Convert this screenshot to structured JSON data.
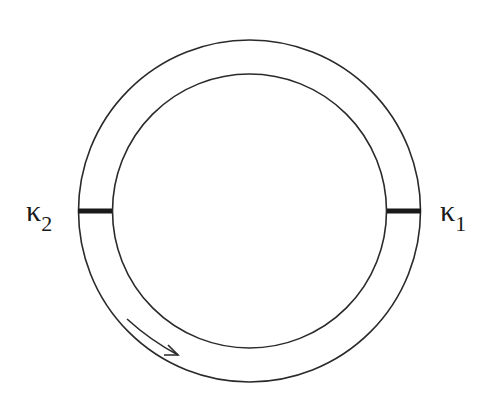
{
  "diagram": {
    "type": "ring-resonator",
    "colors": {
      "stroke": "#2a2a2a",
      "coupler": "#1a1a1a",
      "background": "#ffffff"
    },
    "ring": {
      "cx": 249.5,
      "cy": 211,
      "outer_r": 171,
      "inner_r": 137
    },
    "labels": {
      "left": {
        "symbol": "κ",
        "subscript": "2"
      },
      "right": {
        "symbol": "κ",
        "subscript": "1"
      }
    },
    "arrow": {
      "direction": "clockwise-along-ring"
    }
  }
}
